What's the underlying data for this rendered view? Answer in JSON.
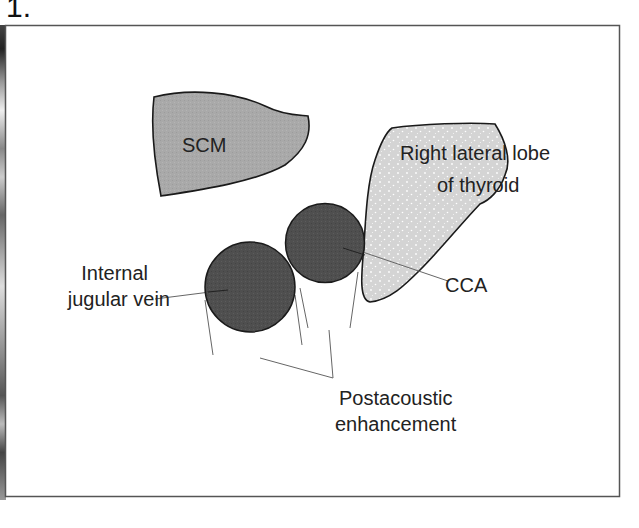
{
  "figure": {
    "number": "1.",
    "labels": {
      "scm": "SCM",
      "thyroid_line1": "Right lateral lobe",
      "thyroid_line2": "of thyroid",
      "cca": "CCA",
      "ijv_line1": "Internal",
      "ijv_line2": "jugular vein",
      "post_line1": "Postacoustic",
      "post_line2": "enhancement"
    },
    "colors": {
      "scm_fill": "#a8a8a8",
      "thyroid_fill": "#d6d6d6",
      "vessel_fill": "#505050",
      "outline": "#1a1a1a",
      "leader": "#555555"
    }
  }
}
